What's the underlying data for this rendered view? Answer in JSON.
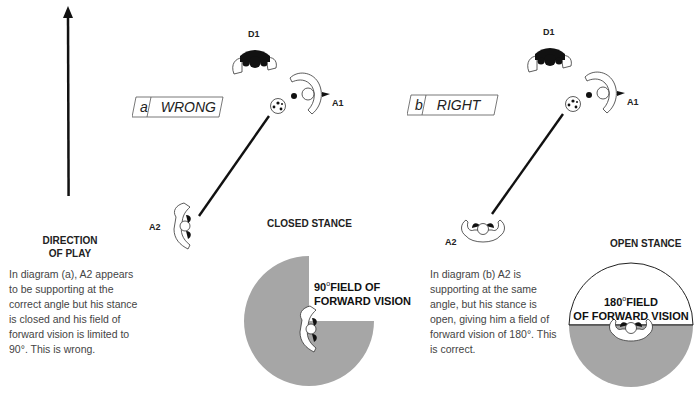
{
  "direction": {
    "line1": "DIRECTION",
    "line2": "OF PLAY"
  },
  "diagram_a": {
    "tag_letter": "a",
    "tag_label": "WRONG",
    "players": {
      "defender": "D1",
      "attacker1": "A1",
      "attacker2": "A2"
    },
    "stance_title": "CLOSED STANCE",
    "field_deg": "90",
    "field_deg_symbol": "o",
    "field_line1": "FIELD OF",
    "field_line2": "FORWARD VISION",
    "description": "In diagram (a), A2 appears to be supporting at the correct angle but his stance is closed and his field of forward vision is limited to 90°. This is wrong."
  },
  "diagram_b": {
    "tag_letter": "b",
    "tag_label": "RIGHT",
    "players": {
      "defender": "D1",
      "attacker1": "A1",
      "attacker2": "A2"
    },
    "stance_title": "OPEN STANCE",
    "field_deg": "180",
    "field_deg_symbol": "o",
    "field_line1": "FIELD",
    "field_line2": "OF FORWARD VISION",
    "description": "In diagram (b) A2 is supporting at the same angle, but his stance is open, giving him a field of forward vision of 180°. This is correct."
  },
  "colors": {
    "field_gray": "#a6a6a6",
    "ink": "#111111"
  }
}
